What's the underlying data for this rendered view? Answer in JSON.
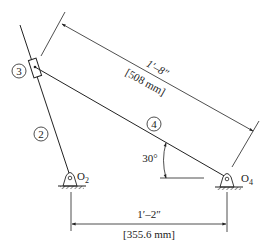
{
  "diagram": {
    "type": "mechanism-schematic",
    "links": [
      {
        "id": "2",
        "label": "2"
      },
      {
        "id": "3",
        "label": "3"
      },
      {
        "id": "4",
        "label": "4"
      }
    ],
    "pivots": [
      {
        "id": "O2",
        "label": "O",
        "subscript": "2"
      },
      {
        "id": "O4",
        "label": "O",
        "subscript": "4"
      }
    ],
    "dimensions": {
      "link4_length": {
        "imperial": "1′–8″",
        "metric": "[508 mm]"
      },
      "ground_length": {
        "imperial": "1′–2″",
        "metric": "[355.6 mm]"
      }
    },
    "angle": {
      "label": "30°"
    },
    "colors": {
      "line": "#222222",
      "background": "#ffffff"
    }
  }
}
